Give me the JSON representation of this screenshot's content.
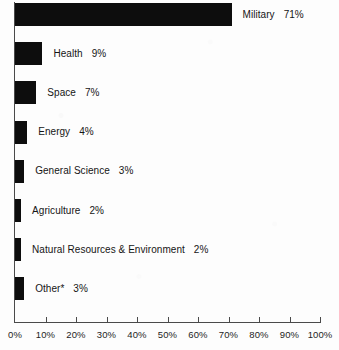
{
  "chart_data": {
    "type": "bar",
    "orientation": "horizontal",
    "title": "",
    "xlabel": "",
    "ylabel": "",
    "xlim": [
      0,
      100
    ],
    "grid": false,
    "legend": null,
    "bar_color": "#0d0d0d",
    "axis_color": "#4a4a4a",
    "background_color": "#fdfdfd",
    "categories": [
      "Military",
      "Health",
      "Space",
      "Energy",
      "General Science",
      "Agriculture",
      "Natural Resources & Environment",
      "Other*"
    ],
    "values": [
      71,
      9,
      7,
      4,
      3,
      2,
      2,
      3
    ],
    "value_labels": [
      "71%",
      "9%",
      "7%",
      "4%",
      "3%",
      "2%",
      "2%",
      "3%"
    ],
    "xticks": [
      0,
      10,
      20,
      30,
      40,
      50,
      60,
      70,
      80,
      90,
      100
    ],
    "xticklabels": [
      "0%",
      "10%",
      "20%",
      "30%",
      "40%",
      "50%",
      "60%",
      "70%",
      "80%",
      "90%",
      "100%"
    ]
  },
  "bars": [
    {
      "label": "Military",
      "value": 71,
      "value_label": "71%"
    },
    {
      "label": "Health",
      "value": 9,
      "value_label": "9%"
    },
    {
      "label": "Space",
      "value": 7,
      "value_label": "7%"
    },
    {
      "label": "Energy",
      "value": 4,
      "value_label": "4%"
    },
    {
      "label": "General Science",
      "value": 3,
      "value_label": "3%"
    },
    {
      "label": "Agriculture",
      "value": 2,
      "value_label": "2%"
    },
    {
      "label": "Natural Resources & Environment",
      "value": 2,
      "value_label": "2%"
    },
    {
      "label": "Other*",
      "value": 3,
      "value_label": "3%"
    }
  ],
  "axis": {
    "ticks": [
      {
        "value": 0,
        "label": "0%"
      },
      {
        "value": 10,
        "label": "10%"
      },
      {
        "value": 20,
        "label": "20%"
      },
      {
        "value": 30,
        "label": "30%"
      },
      {
        "value": 40,
        "label": "40%"
      },
      {
        "value": 50,
        "label": "50%"
      },
      {
        "value": 60,
        "label": "60%"
      },
      {
        "value": 70,
        "label": "70%"
      },
      {
        "value": 80,
        "label": "80%"
      },
      {
        "value": 90,
        "label": "90%"
      },
      {
        "value": 100,
        "label": "100%"
      }
    ]
  }
}
